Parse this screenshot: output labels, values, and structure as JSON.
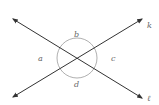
{
  "diagram": {
    "lines": [
      {
        "name": "k",
        "label": "k"
      },
      {
        "name": "l",
        "label": "ℓ"
      }
    ],
    "angles": [
      {
        "name": "a",
        "label": "a"
      },
      {
        "name": "b",
        "label": "b"
      },
      {
        "name": "c",
        "label": "c"
      },
      {
        "name": "d",
        "label": "d"
      }
    ],
    "colors": {
      "line": "#333333",
      "arc": "#999999",
      "label": "#666666"
    }
  }
}
